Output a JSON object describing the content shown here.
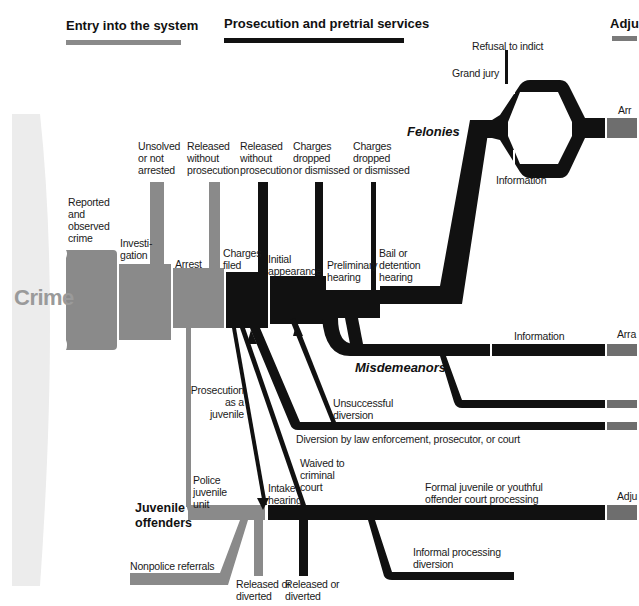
{
  "colors": {
    "entry_gray": "#8a8a8a",
    "dark_flow": "#111111",
    "adjudication_gray": "#6e6e6e",
    "crime_bg": "#ebebeb",
    "crime_text": "#9a9a9a"
  },
  "stages": {
    "entry": {
      "label": "Entry into the system",
      "color": "#8a8a8a"
    },
    "prosecution": {
      "label": "Prosecution and pretrial services",
      "color": "#111111"
    },
    "adjudication": {
      "label": "Adju",
      "color": "#7a7a7a"
    }
  },
  "crime": {
    "label": "Crime"
  },
  "labels": {
    "reported": "Reported\nand\nobserved\ncrime",
    "investigation": "Investi-\ngation",
    "unsolved": "Unsolved\nor not\narrested",
    "released_1": "Released\nwithout\nprosecution",
    "arrest": "Arrest",
    "released_2": "Released\nwithout\nprosecution",
    "charges_filed": "Charges\nfiled",
    "dropped_1": "Charges\ndropped\nor dismissed",
    "initial_appearance": "Initial\nappearance",
    "dropped_2": "Charges\ndropped\nor dismissed",
    "preliminary_hearing": "Preliminary\nhearing",
    "bail": "Bail or\ndetention\nhearing",
    "refusal_to_indict": "Refusal to indict",
    "grand_jury": "Grand jury",
    "information_felony": "Information",
    "information_misd": "Information",
    "arraignment_felony": "Arr",
    "arraignment_misd": "Arra",
    "adjudication_juv": "Adju",
    "prosecution_juvenile": "Prosecution\nas a\njuvenile",
    "unsuccessful_diversion": "Unsuccessful\ndiversion",
    "diversion": "Diversion by law enforcement, prosecutor, or court",
    "waived": "Waived to\ncriminal\ncourt",
    "police_juvenile_unit": "Police\njuvenile\nunit",
    "intake_hearing": "Intake\nhearing",
    "formal_juvenile": "Formal juvenile or youthful\noffender court processing",
    "informal_processing": "Informal processing\ndiversion",
    "nonpolice_referrals": "Nonpolice referrals",
    "released_diverted_1": "Released or\ndiverted",
    "released_diverted_2": "Released or\ndiverted"
  },
  "categories": {
    "felonies": "Felonies",
    "misdemeanors": "Misdemeanors",
    "juvenile": "Juvenile\noffenders"
  }
}
